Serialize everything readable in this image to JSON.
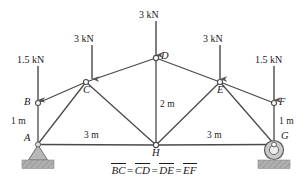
{
  "figure": {
    "type": "truss-free-body-diagram",
    "width": 308,
    "height": 187,
    "relation": {
      "terms": [
        "BC",
        "CD",
        "DE",
        "EF"
      ],
      "equals": "="
    }
  },
  "joints": [
    {
      "id": "A",
      "label": "A",
      "x": 38,
      "y": 144
    },
    {
      "id": "B",
      "label": "B",
      "x": 38,
      "y": 103
    },
    {
      "id": "C",
      "label": "C",
      "x": 86,
      "y": 82
    },
    {
      "id": "D",
      "label": "D",
      "x": 156,
      "y": 58
    },
    {
      "id": "E",
      "label": "E",
      "x": 220,
      "y": 82
    },
    {
      "id": "F",
      "label": "F",
      "x": 274,
      "y": 103
    },
    {
      "id": "G",
      "label": "G",
      "x": 274,
      "y": 144
    },
    {
      "id": "H",
      "label": "H",
      "x": 156,
      "y": 145
    }
  ],
  "members": [
    {
      "from": "A",
      "to": "B"
    },
    {
      "from": "B",
      "to": "C"
    },
    {
      "from": "C",
      "to": "D"
    },
    {
      "from": "D",
      "to": "E"
    },
    {
      "from": "E",
      "to": "F"
    },
    {
      "from": "F",
      "to": "G"
    },
    {
      "from": "A",
      "to": "C"
    },
    {
      "from": "C",
      "to": "H"
    },
    {
      "from": "D",
      "to": "H"
    },
    {
      "from": "H",
      "to": "E"
    },
    {
      "from": "E",
      "to": "G"
    },
    {
      "from": "A",
      "to": "H"
    },
    {
      "from": "H",
      "to": "G"
    }
  ],
  "loads": [
    {
      "id": "load-B",
      "at": "B",
      "value": "1.5 kN",
      "magnitude": 1.5,
      "unit": "kN",
      "direction": "down",
      "label_x": 17,
      "label_y": 55,
      "arrow_x": 38,
      "arrow_top": 66,
      "arrow_bottom": 100
    },
    {
      "id": "load-C",
      "at": "C",
      "value": "3 kN",
      "magnitude": 3,
      "unit": "kN",
      "direction": "down",
      "label_x": 74,
      "label_y": 34,
      "arrow_x": 92,
      "arrow_top": 45,
      "arrow_bottom": 79
    },
    {
      "id": "load-D",
      "at": "D",
      "value": "3 kN",
      "magnitude": 3,
      "unit": "kN",
      "direction": "down",
      "label_x": 139,
      "label_y": 10,
      "arrow_x": 156,
      "arrow_top": 21,
      "arrow_bottom": 55
    },
    {
      "id": "load-E",
      "at": "E",
      "value": "3 kN",
      "magnitude": 3,
      "unit": "kN",
      "direction": "down",
      "label_x": 203,
      "label_y": 34,
      "arrow_x": 220,
      "arrow_top": 45,
      "arrow_bottom": 79
    },
    {
      "id": "load-F",
      "at": "F",
      "value": "1.5 kN",
      "magnitude": 1.5,
      "unit": "kN",
      "direction": "down",
      "label_x": 255,
      "label_y": 55,
      "arrow_x": 274,
      "arrow_top": 66,
      "arrow_bottom": 100
    }
  ],
  "dimensions": [
    {
      "id": "dim-AB",
      "value": "1 m",
      "label_x": 11,
      "label_y": 117
    },
    {
      "id": "dim-FG",
      "value": "1 m",
      "label_x": 279,
      "label_y": 117
    },
    {
      "id": "dim-DH",
      "value": "2 m",
      "label_x": 160,
      "label_y": 100
    },
    {
      "id": "dim-AH",
      "value": "3 m",
      "label_x": 84,
      "label_y": 131
    },
    {
      "id": "dim-HG",
      "value": "3 m",
      "label_x": 207,
      "label_y": 131
    }
  ],
  "supports": [
    {
      "id": "support-A",
      "at": "A",
      "kind": "pin",
      "x": 38,
      "y": 144
    },
    {
      "id": "support-G",
      "at": "G",
      "kind": "roller",
      "x": 274,
      "y": 144
    }
  ],
  "colors": {
    "member": "#4a4a4a",
    "arrow": "#555555",
    "text": "#1a1a1a",
    "support_fill": "#b8b8b8",
    "ground_fill": "#a8a8a8",
    "joint_fill": "#ffffff"
  }
}
